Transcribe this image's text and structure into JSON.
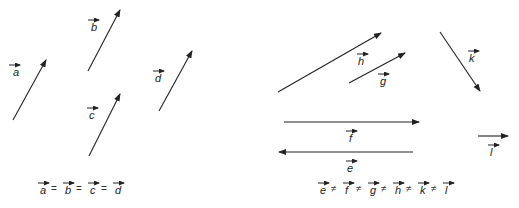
{
  "diagram": {
    "colors": {
      "stroke": "#222222",
      "background": "#ffffff"
    },
    "vectors": [
      {
        "name": "a",
        "x1": 13,
        "y1": 120,
        "x2": 46,
        "y2": 60,
        "lx": 13,
        "ly": 76,
        "barx": 9
      },
      {
        "name": "b",
        "x1": 88,
        "y1": 71,
        "x2": 120,
        "y2": 10,
        "lx": 91,
        "ly": 31,
        "barx": 88
      },
      {
        "name": "c",
        "x1": 89,
        "y1": 156,
        "x2": 120,
        "y2": 94,
        "lx": 89,
        "ly": 119,
        "barx": 87
      },
      {
        "name": "d",
        "x1": 159,
        "y1": 111,
        "x2": 192,
        "y2": 51,
        "lx": 155,
        "ly": 82,
        "barx": 153
      },
      {
        "name": "h",
        "x1": 278,
        "y1": 92,
        "x2": 381,
        "y2": 33,
        "lx": 358,
        "ly": 65,
        "barx": 357
      },
      {
        "name": "g",
        "x1": 349,
        "y1": 83,
        "x2": 405,
        "y2": 53,
        "lx": 380,
        "ly": 85,
        "barx": 378
      },
      {
        "name": "k",
        "x1": 440,
        "y1": 32,
        "x2": 480,
        "y2": 91,
        "lx": 469,
        "ly": 62,
        "barx": 468
      },
      {
        "name": "f",
        "x1": 284,
        "y1": 122,
        "x2": 419,
        "y2": 122,
        "lx": 349,
        "ly": 142,
        "barx": 346
      },
      {
        "name": "e",
        "x1": 413,
        "y1": 152,
        "x2": 279,
        "y2": 152,
        "lx": 347,
        "ly": 172,
        "barx": 346
      },
      {
        "name": "l",
        "x1": 478,
        "y1": 136,
        "x2": 508,
        "y2": 136,
        "lx": 490,
        "ly": 156,
        "barx": 488
      }
    ],
    "equations": [
      {
        "name": "equal-vectors",
        "terms": [
          "a",
          "b",
          "c",
          "d"
        ],
        "operator": "=",
        "x": 40,
        "y": 194,
        "spacing": 25
      },
      {
        "name": "unequal-vectors",
        "terms": [
          "e",
          "f",
          "g",
          "h",
          "k",
          "l"
        ],
        "operator": "≠",
        "x": 320,
        "y": 194,
        "spacing": 25
      }
    ]
  }
}
